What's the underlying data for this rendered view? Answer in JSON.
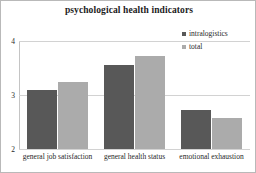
{
  "chart_data": {
    "type": "bar",
    "title": "psychological health indicators",
    "xlabel": "",
    "ylabel": "",
    "categories": [
      "general job satisfaction",
      "general health status",
      "emotional exhaustion"
    ],
    "series": [
      {
        "name": "intralogistics",
        "color": "#585858",
        "values": [
          3.09,
          3.55,
          2.72
        ]
      },
      {
        "name": "total",
        "color": "#ababab",
        "values": [
          3.25,
          3.73,
          2.58
        ]
      }
    ],
    "ylim": [
      2,
      4
    ],
    "yticks": [
      2,
      3,
      4
    ],
    "ytick_labels": [
      "2",
      "3",
      "4"
    ],
    "grid": true,
    "legend_position": "top-right",
    "border": true
  }
}
